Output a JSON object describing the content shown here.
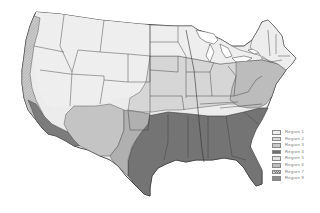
{
  "map": {
    "title": "",
    "subject": "Contiguous United States divided into 8 regions",
    "colors": {
      "background": "#ffffff",
      "border": "#3a3a3a",
      "region_1": "#efefef",
      "region_2": "#d9d9d9",
      "region_3": "#c8c8c8",
      "region_4": "#6f6f6f",
      "region_5": "#e4e4e4",
      "region_6": "#b4b4b4",
      "region_7": "#a8a8a8",
      "region_8": "#8a8a8a",
      "dotted_west": "#f2f2f2"
    }
  },
  "legend": {
    "items": [
      {
        "label": "Region 1",
        "color": "#efefef"
      },
      {
        "label": "Region 2",
        "color": "#dcdcdc"
      },
      {
        "label": "Region 3",
        "color": "#cacaca"
      },
      {
        "label": "Region 4",
        "color": "#6f6f6f"
      },
      {
        "label": "Region 5",
        "color": "#e4e4e4"
      },
      {
        "label": "Region 6",
        "color": "#bdbdbd"
      },
      {
        "label": "Region 7",
        "color": "#a9a9a9"
      },
      {
        "label": "Region 8",
        "color": "#8c8c8c"
      }
    ]
  }
}
